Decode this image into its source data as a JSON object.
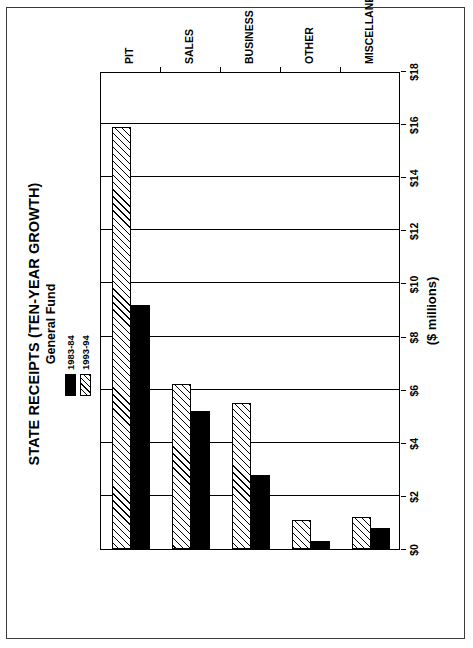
{
  "chart_data": {
    "type": "bar",
    "orientation": "horizontal-printed-rotated",
    "title": "STATE RECEIPTS (TEN-YEAR GROWTH)",
    "subtitle": "General Fund",
    "xlabel": "",
    "ylabel": "($ millions)",
    "axis_title": "($ millions)",
    "categories": [
      "PIT",
      "SALES",
      "BUSINESS",
      "OTHER",
      "MISCELLANEOUS"
    ],
    "series": [
      {
        "name": "1983-84",
        "pattern": "solid",
        "color": "#000000",
        "values": [
          9.2,
          5.2,
          2.8,
          0.3,
          0.8
        ]
      },
      {
        "name": "1993-94",
        "pattern": "hatched",
        "color": "#ffffff",
        "values": [
          15.9,
          6.2,
          5.5,
          1.1,
          1.2
        ]
      }
    ],
    "ylim": [
      0,
      18
    ],
    "tick_labels": [
      "$0",
      "$2",
      "$4",
      "$6",
      "$8",
      "$10",
      "$12",
      "$14",
      "$16",
      "$18"
    ],
    "tick_values": [
      0,
      2,
      4,
      6,
      8,
      10,
      12,
      14,
      16,
      18
    ],
    "grid": true,
    "legend_position": "top-center"
  },
  "legend": {
    "entries": [
      {
        "label": "1983-84"
      },
      {
        "label": "1993-94"
      }
    ]
  }
}
